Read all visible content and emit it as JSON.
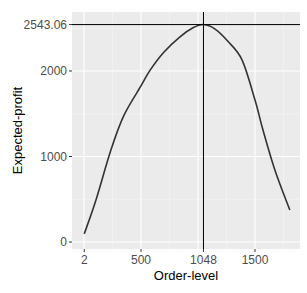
{
  "chart_data": {
    "type": "line",
    "title": "",
    "xlabel": "Order-level",
    "ylabel": "Expected-profit",
    "xlim": [
      -80,
      1910
    ],
    "ylim": [
      -90,
      2700
    ],
    "x_ticks": [
      {
        "value": 2,
        "label": "2"
      },
      {
        "value": 500,
        "label": "500"
      },
      {
        "value": 1048,
        "label": "1048"
      },
      {
        "value": 1500,
        "label": "1500"
      }
    ],
    "y_ticks": [
      {
        "value": 0,
        "label": "0"
      },
      {
        "value": 1000,
        "label": "1000"
      },
      {
        "value": 2000,
        "label": "2000"
      },
      {
        "value": 2543.06,
        "label": "2543.06"
      }
    ],
    "major_gridlines_x": [
      0,
      500,
      1000,
      1500
    ],
    "minor_gridlines_x": [
      250,
      750,
      1250,
      1750
    ],
    "major_gridlines_y": [
      0,
      1000,
      2000
    ],
    "minor_gridlines_y": [
      500,
      1500,
      2500
    ],
    "reference_lines": {
      "vertical_x": 1048,
      "horizontal_y": 2543.06
    },
    "grid": true,
    "legend": null,
    "series": [
      {
        "name": "Expected-profit",
        "x": [
          2,
          100,
          236,
          350,
          500,
          580,
          700,
          842,
          956,
          1048,
          1150,
          1260,
          1386,
          1500,
          1570,
          1675,
          1805
        ],
        "y": [
          95,
          470,
          1075,
          1480,
          1825,
          2010,
          2220,
          2400,
          2505,
          2543.06,
          2490,
          2350,
          2130,
          1660,
          1310,
          840,
          375
        ]
      }
    ],
    "colors": {
      "panel_bg": "#ebebeb",
      "grid_major": "#ffffff",
      "grid_minor": "#f5f5f5",
      "line": "#333333",
      "ref_line": "#000000",
      "tick_text": "#4d4d4d"
    }
  }
}
